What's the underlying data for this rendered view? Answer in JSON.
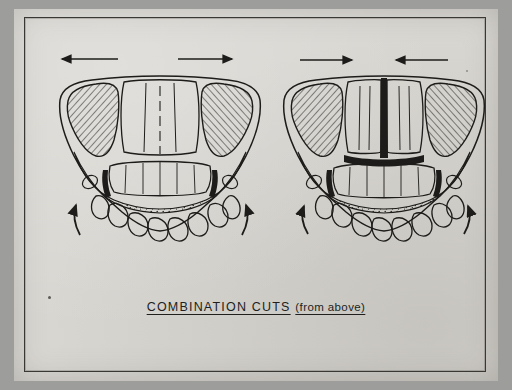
{
  "figure": {
    "caption_main": "COMBINATION  CUTS",
    "caption_sub": "(from above)",
    "background_color": "#d8d6d1",
    "ink_color": "#1d1c1a",
    "frame_color": "#3a3835",
    "panels": [
      {
        "id": "left-panel",
        "name": "combination-cut-left",
        "description": "Maxillary arch viewed from above with bilateral posterior osteotomy segments, hatched palatal shelves, stippled alveolar bone, and outward-pointing arrows indicating lateral expansion.",
        "top_arrows": [
          "left-arrow",
          "right-arrow"
        ],
        "bottom_arrows": [
          "curved-arrow-left",
          "curved-arrow-right"
        ],
        "cut_marks": [
          "left-vertical-cut",
          "right-vertical-cut"
        ]
      },
      {
        "id": "right-panel",
        "name": "combination-cut-right",
        "description": "Maxillary arch viewed from above with a midline sagittal split shown as a solid black band, plus bilateral posterior cuts and arrows indicating segment movement.",
        "top_arrows": [
          "left-arrow",
          "right-arrow"
        ],
        "bottom_arrows": [
          "curved-arrow-left",
          "curved-arrow-right"
        ],
        "cut_marks": [
          "midline-sagittal-cut",
          "transverse-cut",
          "left-vertical-cut",
          "right-vertical-cut"
        ]
      }
    ]
  }
}
